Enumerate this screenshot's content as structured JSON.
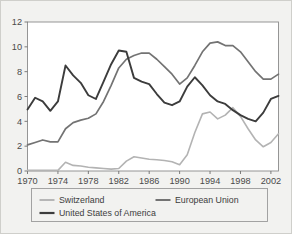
{
  "figure": {
    "background_color": "#f2f2f0",
    "border_color": "#cfcfcb",
    "axis_color": "#6e6e6e"
  },
  "chart_data": {
    "type": "line",
    "title": "",
    "subtitle": "",
    "xlabel": "",
    "ylabel": "",
    "xlim": [
      1970,
      2003
    ],
    "ylim": [
      0,
      12
    ],
    "grid": false,
    "legend_position": "bottom",
    "xticks": [
      1970,
      1974,
      1978,
      1982,
      1986,
      1990,
      1994,
      1998,
      2002
    ],
    "xtick_labels": [
      "1970",
      "1974",
      "1978",
      "1982",
      "1986",
      "1990",
      "1994",
      "1998",
      "2002"
    ],
    "yticks": [
      0,
      2,
      4,
      6,
      8,
      10,
      12
    ],
    "ytick_labels": [
      "0",
      "2",
      "4",
      "6",
      "8",
      "10",
      "12"
    ],
    "x": [
      1970,
      1971,
      1972,
      1973,
      1974,
      1975,
      1976,
      1977,
      1978,
      1979,
      1980,
      1981,
      1982,
      1983,
      1984,
      1985,
      1986,
      1987,
      1988,
      1989,
      1990,
      1991,
      1992,
      1993,
      1994,
      1995,
      1996,
      1997,
      1998,
      1999,
      2000,
      2001,
      2002,
      2003
    ],
    "series": [
      {
        "name": "Switzerland",
        "color": "#b3b3b3",
        "width": 1.6,
        "values": [
          0.05,
          0.05,
          0.05,
          0.05,
          0.05,
          0.7,
          0.45,
          0.4,
          0.3,
          0.25,
          0.2,
          0.15,
          0.2,
          0.8,
          1.15,
          1.05,
          0.95,
          0.9,
          0.85,
          0.75,
          0.5,
          1.3,
          3.1,
          4.6,
          4.75,
          4.2,
          4.5,
          5.1,
          4.4,
          3.4,
          2.5,
          1.95,
          2.3,
          3.0
        ]
      },
      {
        "name": "European Union",
        "color": "#737373",
        "width": 1.7,
        "values": [
          2.1,
          2.3,
          2.5,
          2.35,
          2.35,
          3.4,
          3.9,
          4.1,
          4.25,
          4.6,
          5.6,
          6.9,
          8.3,
          9.0,
          9.3,
          9.5,
          9.5,
          9.0,
          8.4,
          7.8,
          7.0,
          7.5,
          8.5,
          9.6,
          10.3,
          10.4,
          10.1,
          10.1,
          9.6,
          8.8,
          8.0,
          7.4,
          7.4,
          7.8
        ]
      },
      {
        "name": "United States of America",
        "color": "#3c3c3c",
        "width": 1.9,
        "values": [
          4.95,
          5.9,
          5.6,
          4.85,
          5.6,
          8.5,
          7.7,
          7.1,
          6.1,
          5.8,
          7.2,
          8.6,
          9.7,
          9.6,
          7.5,
          7.2,
          7.0,
          6.2,
          5.5,
          5.3,
          5.6,
          6.8,
          7.55,
          6.9,
          6.1,
          5.6,
          5.4,
          4.9,
          4.5,
          4.2,
          4.0,
          4.7,
          5.8,
          6.05
        ]
      }
    ]
  },
  "legend": {
    "entries": [
      {
        "label": "Switzerland"
      },
      {
        "label": "European Union"
      },
      {
        "label": "United States of America"
      }
    ]
  }
}
